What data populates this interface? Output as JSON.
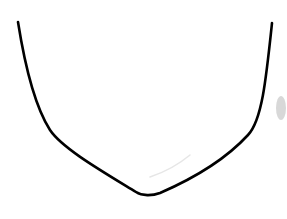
{
  "drawing": {
    "description": "U-shaped chin/jaw outline line drawing",
    "background_color": "#ffffff",
    "stroke_color": "#000000",
    "stroke_width": 2.6,
    "main_curve_path": "M18,22 C24,60 34,105 50,130 C62,148 100,170 136,192 C142,196 152,196 160,193 C190,180 225,160 248,135 C262,120 266,80 272,23",
    "faint_stroke_path": "M150,177 C165,172 178,165 190,155",
    "faint_stroke_color": "#e6e6e6",
    "smudge": {
      "cx": 281,
      "cy": 108,
      "rx": 5,
      "ry": 12,
      "color": "#c8c8c8"
    }
  }
}
